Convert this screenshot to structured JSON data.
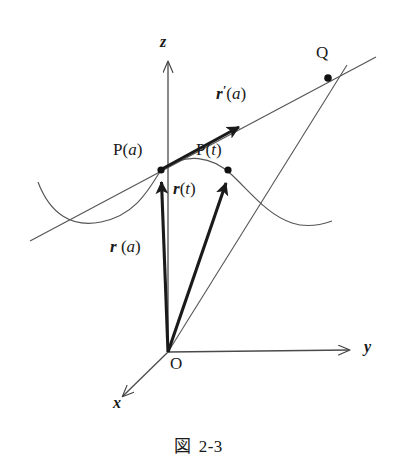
{
  "figure": {
    "caption_symbol": "図",
    "caption_number": "2-3",
    "caption_full": "図 2-3",
    "background_color": "#ffffff",
    "ink_color": "#1a1a1a",
    "line_color": "#4a4a4a"
  },
  "axes": [
    {
      "id": "z",
      "label": "z",
      "direction": "up",
      "tip": [
        168,
        55
      ],
      "origin": [
        168,
        352
      ]
    },
    {
      "id": "y",
      "label": "y",
      "direction": "right",
      "tip": [
        356,
        348
      ],
      "origin": [
        168,
        352
      ]
    },
    {
      "id": "x",
      "label": "x",
      "direction": "down-left",
      "tip": [
        120,
        400
      ],
      "origin": [
        168,
        352
      ]
    }
  ],
  "origin": {
    "label": "O",
    "x": 168,
    "y": 352
  },
  "points": [
    {
      "id": "Pa",
      "label_prefix": "P",
      "label_arg": "a",
      "label": "P(a)",
      "x": 161,
      "y": 170
    },
    {
      "id": "Pt",
      "label_prefix": "P",
      "label_arg": "t",
      "label": "P(t)",
      "x": 228,
      "y": 170
    },
    {
      "id": "Q",
      "label_prefix": "Q",
      "label_arg": "",
      "label": "Q",
      "x": 328,
      "y": 78
    }
  ],
  "vectors": [
    {
      "id": "r_a",
      "symbol": "r",
      "prime": "",
      "arg": "a",
      "label": "r (a)",
      "from": [
        168,
        352
      ],
      "to": [
        161,
        170
      ],
      "style": "bold"
    },
    {
      "id": "r_t",
      "symbol": "r",
      "prime": "",
      "arg": "t",
      "label": "r(t)",
      "from": [
        168,
        352
      ],
      "to": [
        228,
        170
      ],
      "style": "bold"
    },
    {
      "id": "rp_a",
      "symbol": "r",
      "prime": "′",
      "arg": "a",
      "label": "r′(a)",
      "from": [
        161,
        170
      ],
      "to": [
        248,
        122
      ],
      "style": "bold"
    }
  ],
  "lines": [
    {
      "id": "tangent-line",
      "label": "tangent at P(a)",
      "from": [
        30,
        241
      ],
      "to": [
        376,
        57
      ]
    },
    {
      "id": "secant-line",
      "label": "line O to Q",
      "from": [
        168,
        352
      ],
      "to": [
        348,
        64
      ]
    }
  ],
  "curve": {
    "id": "space-curve",
    "label": "curve P(t)",
    "path": "M 38,182 C 50,214 72,228 101,222 C 135,215 148,191 161,170 C 186,152 212,156 232,175 C 252,194 268,215 292,223 C 304,227 318,226 332,221"
  },
  "labels": {
    "z_axis": {
      "text": "z",
      "x": 160,
      "y": 34
    },
    "y_axis": {
      "text": "y",
      "x": 364,
      "y": 339
    },
    "x_axis": {
      "text": "x",
      "x": 113,
      "y": 404
    },
    "origin": {
      "text": "O",
      "x": 170,
      "y": 357
    },
    "point_Pa": {
      "text": "P(a)",
      "x": 113,
      "y": 141
    },
    "point_Pt": {
      "text": "P(t)",
      "x": 196,
      "y": 141
    },
    "point_Q": {
      "text": "Q",
      "x": 316,
      "y": 44
    },
    "vec_ra": {
      "text": "r (a)",
      "x": 110,
      "y": 238
    },
    "vec_rt": {
      "text": "r(t)",
      "x": 173,
      "y": 180
    },
    "vec_rpa": {
      "text": "r′(a)",
      "x": 216,
      "y": 83
    }
  }
}
